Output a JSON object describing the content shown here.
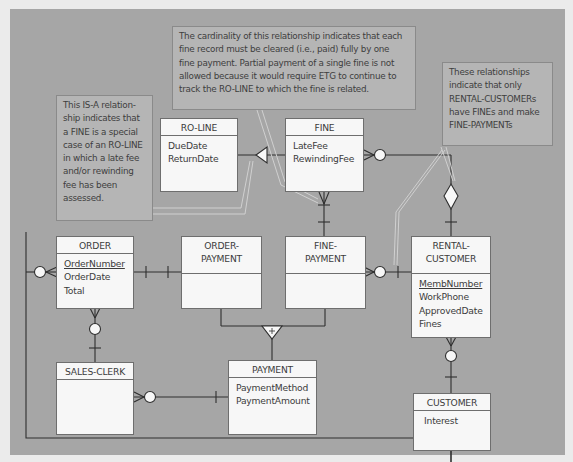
{
  "diagram": {
    "type": "entity-relationship",
    "notes": {
      "isa_note": {
        "lines": [
          "This IS-A relation-",
          "ship indicates that",
          "a FINE is a special",
          "case of an RO-LINE",
          "in which a late fee",
          "and/or rewinding",
          "fee has been",
          "assessed."
        ]
      },
      "cardinality_note": {
        "lines": [
          "The cardinality of this relationship indicates that each",
          "fine record must be cleared (i.e., paid) fully by one",
          "fine payment. Partial payment of a single fine is not",
          "allowed because it would require ETG to continue to",
          "track the RO-LINE to which the fine is related."
        ]
      },
      "rental_note": {
        "lines": [
          "These relationships",
          "indicate that only",
          "RENTAL-CUSTOMERs",
          "have FINEs and make",
          "FINE-PAYMENTs"
        ]
      }
    },
    "entities": {
      "ro_line": {
        "name": "RO-LINE",
        "attributes": [
          "DueDate",
          "ReturnDate"
        ]
      },
      "fine": {
        "name": "FINE",
        "attributes": [
          "LateFee",
          "RewindingFee"
        ]
      },
      "order": {
        "name": "ORDER",
        "key": "OrderNumber",
        "attributes": [
          "OrderDate",
          "Total"
        ]
      },
      "order_payment": {
        "name_line1": "ORDER-",
        "name_line2": "PAYMENT"
      },
      "fine_payment": {
        "name_line1": "FINE-",
        "name_line2": "PAYMENT"
      },
      "rental_customer": {
        "name_line1": "RENTAL-",
        "name_line2": "CUSTOMER",
        "key": "MembNumber",
        "attributes": [
          "WorkPhone",
          "ApprovedDate",
          "Fines"
        ]
      },
      "sales_clerk": {
        "name": "SALES-CLERK"
      },
      "payment": {
        "name": "PAYMENT",
        "attributes": [
          "PaymentMethod",
          "PaymentAmount"
        ]
      },
      "customer": {
        "name": "CUSTOMER",
        "attributes": [
          "Interest"
        ]
      }
    },
    "symbols": {
      "subtype_plus": "+"
    },
    "colors": {
      "background": "#a6a6a6",
      "entity_fill": "#f7f7f7",
      "note_fill": "#b5b5b5",
      "line": "#2e2e2e"
    }
  }
}
